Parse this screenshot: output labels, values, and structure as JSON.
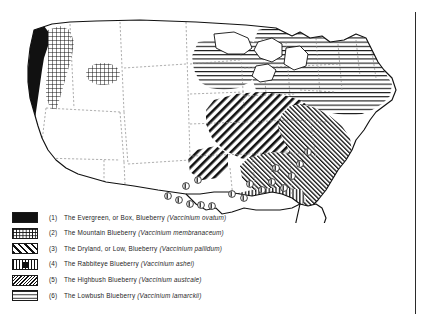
{
  "figure": {
    "type": "thematic-distribution-map",
    "region": "United States",
    "title": "",
    "border_rules": [
      "top-horizontal-rule",
      "right-vertical-rule"
    ]
  },
  "legend": {
    "title": "",
    "items": [
      {
        "number": "(1)",
        "common_name": "The Evergreen, or Box, Blueberry",
        "scientific_name": "(Vaccinium ovatum)",
        "pattern": "solid-black",
        "pattern_class": "sw-solid",
        "icon": "solid-fill-swatch-icon",
        "color": "#111111"
      },
      {
        "number": "(2)",
        "common_name": "The Mountain Blueberry",
        "scientific_name": "(Vaccinium membranaceum)",
        "pattern": "fine-grid",
        "pattern_class": "sw-grid",
        "icon": "grid-fill-swatch-icon",
        "color": "#111111"
      },
      {
        "number": "(3)",
        "common_name": "The Dryland, or Low, Blueberry",
        "scientific_name": "(Vaccinium pallidum)",
        "pattern": "bold-diagonal-hatch",
        "pattern_class": "sw-diag",
        "icon": "diagonal-hatch-swatch-icon",
        "color": "#111111"
      },
      {
        "number": "(4)",
        "common_name": "The Rabbiteye Blueberry",
        "scientific_name": "(Vaccinium ashei)",
        "pattern": "vertical-bars-with-center-block",
        "pattern_class": "sw-vbar-center",
        "icon": "vertical-bar-swatch-icon",
        "color": "#111111"
      },
      {
        "number": "(5)",
        "common_name": "The Highbush Blueberry",
        "scientific_name": "(Vaccinium austcale)",
        "pattern": "fine-diagonal-crosshatch",
        "pattern_class": "sw-fine-cross",
        "icon": "fine-hatch-swatch-icon",
        "color": "#111111"
      },
      {
        "number": "(6)",
        "common_name": "The Lowbush Blueberry",
        "scientific_name": "(Vaccinium lamarckii)",
        "pattern": "horizontal-lines",
        "pattern_class": "sw-hlines",
        "icon": "horizontal-line-swatch-icon",
        "color": "#111111"
      }
    ]
  },
  "map": {
    "outline_color": "#111111",
    "state_border_color": "#8d8d8d",
    "state_border_style": "dashed",
    "background": "#ffffff",
    "regions": [
      {
        "species_ref": 1,
        "name": "pacific-coast-strip",
        "pattern": "solid-black"
      },
      {
        "species_ref": 2,
        "name": "cascades-northern-rockies",
        "pattern": "fine-grid"
      },
      {
        "species_ref": 2,
        "name": "central-idaho-patch",
        "pattern": "fine-grid"
      },
      {
        "species_ref": 6,
        "name": "new-england-great-lakes",
        "pattern": "horizontal-lines"
      },
      {
        "species_ref": 3,
        "name": "ozarks-arkansas-patch",
        "pattern": "bold-diagonal-hatch"
      },
      {
        "species_ref": 3,
        "name": "midwest-appalachian-belt",
        "pattern": "bold-diagonal-hatch"
      },
      {
        "species_ref": 5,
        "name": "atlantic-coastal-plain",
        "pattern": "fine-diagonal-crosshatch"
      },
      {
        "species_ref": 4,
        "name": "gulf-coast-band",
        "pattern": "vertical-bars"
      },
      {
        "species_ref": 4,
        "name": "gulf-states-point-symbols",
        "pattern": "circled-markers",
        "count": 17
      }
    ]
  }
}
